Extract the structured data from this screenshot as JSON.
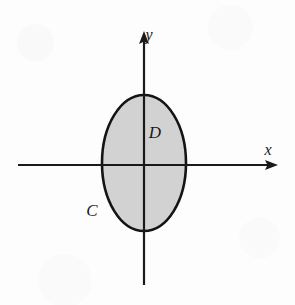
{
  "figure": {
    "canvas": {
      "width": 295,
      "height": 305
    },
    "background_color": "#fdfdfd",
    "axes": {
      "x_axis": {
        "label": "x",
        "label_x": 268,
        "label_y": 151,
        "line_from_x": 18,
        "line_to_x": 272,
        "line_y": 165,
        "arrow_direction": "right",
        "color": "#1a1a1a"
      },
      "y_axis": {
        "label": "y",
        "label_x": 149,
        "label_y": 36,
        "line_from_y": 285,
        "line_to_y": 37,
        "line_x": 144,
        "arrow_direction": "up",
        "color": "#1a1a1a"
      }
    },
    "shapes": [
      {
        "name": "region-ellipse",
        "type": "ellipse",
        "center_x": 144,
        "center_y": 163,
        "radius_x": 42,
        "radius_y": 68,
        "fill_color": "#d2d2d2",
        "stroke_color": "#141414",
        "stroke_width": 2.6
      }
    ],
    "labels": [
      {
        "name": "region-label-D",
        "text": "D",
        "x": 155,
        "y": 134,
        "placement": "inside-region-upper-right",
        "style": "italic-serif"
      },
      {
        "name": "curve-label-C",
        "text": "C",
        "x": 92,
        "y": 212,
        "placement": "outside-lower-left-of-boundary",
        "style": "italic-serif"
      }
    ]
  }
}
